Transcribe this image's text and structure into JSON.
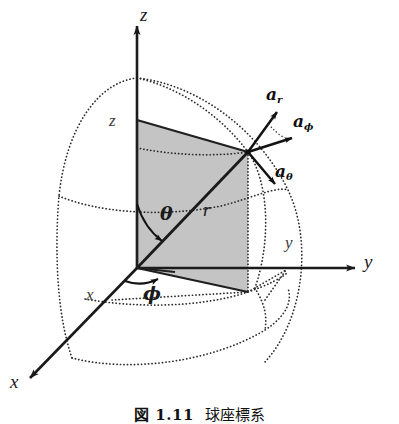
{
  "figure": {
    "kind": "spherical-coordinate-system-diagram",
    "caption": {
      "number": "図 1.11",
      "text": "球座標系"
    },
    "colors": {
      "line": "#1a1a1a",
      "shade_fill": "#c4c4c4",
      "shade_stroke": "#2a2a2a",
      "dotted": "#2b2b2b",
      "background": "#ffffff"
    },
    "axes": [
      {
        "name": "z-axis",
        "label": "z",
        "direction": "up"
      },
      {
        "name": "y-axis",
        "label": "y",
        "direction": "right"
      },
      {
        "name": "x-axis",
        "label": "x",
        "direction": "lower-left"
      }
    ],
    "projection_labels": [
      {
        "name": "z-projection",
        "label": "z"
      },
      {
        "name": "y-projection",
        "label": "y"
      },
      {
        "name": "x-projection",
        "label": "x"
      }
    ],
    "angles": [
      {
        "name": "theta-angle",
        "label": "θ",
        "between": "z-axis and radius"
      },
      {
        "name": "phi-angle",
        "label": "ϕ",
        "between": "x-axis and projection"
      }
    ],
    "radius": {
      "name": "radius-r",
      "label": "r"
    },
    "unit_vectors": [
      {
        "name": "unit-vector-a-r",
        "base": "a",
        "sub": "r"
      },
      {
        "name": "unit-vector-a-phi",
        "base": "a",
        "sub": "ϕ"
      },
      {
        "name": "unit-vector-a-theta",
        "base": "a",
        "sub": "θ"
      }
    ]
  }
}
